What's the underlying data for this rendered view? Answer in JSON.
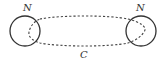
{
  "diagram": {
    "nodes": [
      {
        "id": "left",
        "label": "N",
        "cx": 25,
        "cy": 31,
        "r": 15
      },
      {
        "id": "right",
        "label": "N",
        "cx": 141,
        "cy": 31,
        "r": 15
      }
    ],
    "curve": {
      "label": "C",
      "style": "dashed",
      "connects": [
        "left",
        "right"
      ]
    },
    "colors": {
      "stroke": "#333333",
      "background": "#ffffff"
    }
  }
}
